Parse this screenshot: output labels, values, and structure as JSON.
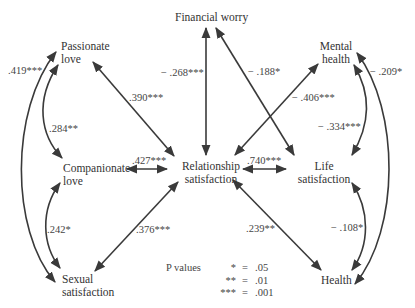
{
  "diagram": {
    "type": "path-correlation-diagram",
    "nodes": {
      "financial_worry": "Financial worry",
      "passionate_love": [
        "Passionate",
        "love"
      ],
      "companionate_love": [
        "Companionate",
        "love"
      ],
      "sexual_satisfaction": [
        "Sexual",
        "satisfaction"
      ],
      "relationship_satisfaction": [
        "Relationship",
        "satisfaction"
      ],
      "mental_health": [
        "Mental",
        "health"
      ],
      "life_satisfaction": [
        "Life",
        "satisfaction"
      ],
      "health": "Health"
    },
    "edges": [
      {
        "from": "Passionate love",
        "to": "Sexual satisfaction",
        "label": ".419***"
      },
      {
        "from": "Passionate love",
        "to": "Companionate love",
        "label": ".284**"
      },
      {
        "from": "Companionate love",
        "to": "Sexual satisfaction",
        "label": ".242*"
      },
      {
        "from": "Passionate love",
        "to": "Relationship satisfaction",
        "label": ".390***"
      },
      {
        "from": "Companionate love",
        "to": "Relationship satisfaction",
        "label": ".427***"
      },
      {
        "from": "Sexual satisfaction",
        "to": "Relationship satisfaction",
        "label": ".376***"
      },
      {
        "from": "Financial worry",
        "to": "Relationship satisfaction",
        "label": "− .268***"
      },
      {
        "from": "Financial worry",
        "to": "Life satisfaction",
        "label": "− .188*"
      },
      {
        "from": "Mental health",
        "to": "Relationship satisfaction",
        "label": "− .406***"
      },
      {
        "from": "Relationship satisfaction",
        "to": "Life satisfaction",
        "label": ".740***"
      },
      {
        "from": "Relationship satisfaction",
        "to": "Health",
        "label": ".239**"
      },
      {
        "from": "Mental health",
        "to": "Life satisfaction",
        "label": "− .334***"
      },
      {
        "from": "Mental health",
        "to": "Health",
        "label": "− .209*"
      },
      {
        "from": "Life satisfaction",
        "to": "Health",
        "label": "− .108*"
      }
    ],
    "legend": {
      "title": "P values",
      "rows": [
        {
          "stars": "*",
          "eq": "=",
          "value": ".05"
        },
        {
          "stars": "**",
          "eq": "=",
          "value": ".01"
        },
        {
          "stars": "***",
          "eq": "=",
          "value": ".001"
        }
      ]
    },
    "colors": {
      "line": "#3a3a3a",
      "text": "#333333",
      "background": "#ffffff"
    }
  }
}
